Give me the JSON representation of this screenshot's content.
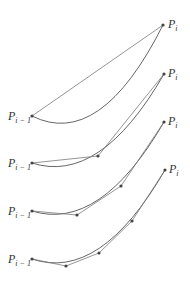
{
  "label_start": "P",
  "label_start_sub": "i − 1",
  "label_end": "P",
  "label_end_sub": "i",
  "panels": [
    {
      "name": "panel-1",
      "subdivisions": 1
    },
    {
      "name": "panel-2",
      "subdivisions": 2
    },
    {
      "name": "panel-3",
      "subdivisions": 3
    },
    {
      "name": "panel-4",
      "subdivisions": 4
    }
  ]
}
